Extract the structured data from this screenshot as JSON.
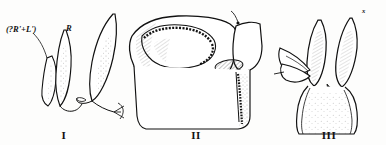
{
  "plate": {
    "background_color": "#fdfdfc",
    "ink_color": "#111111",
    "figures": [
      {
        "numeral": "I",
        "caption_position": "bottom-center",
        "labels": [
          {
            "name": "rl-label",
            "text": "(?R'+L')",
            "leader": true
          },
          {
            "name": "r-label",
            "text": "R",
            "leader": false
          }
        ]
      },
      {
        "numeral": "II",
        "caption_position": "bottom-center",
        "labels": [
          {
            "name": "x-label",
            "text": "x",
            "leader": true
          }
        ]
      },
      {
        "numeral": "III",
        "caption_position": "bottom-center",
        "labels": [
          {
            "name": "li-label",
            "text": "LI",
            "leader": false
          },
          {
            "name": "ld-label",
            "text": "LD",
            "leader": false
          },
          {
            "name": "x-label",
            "text": "x",
            "leader": true
          }
        ]
      }
    ]
  }
}
